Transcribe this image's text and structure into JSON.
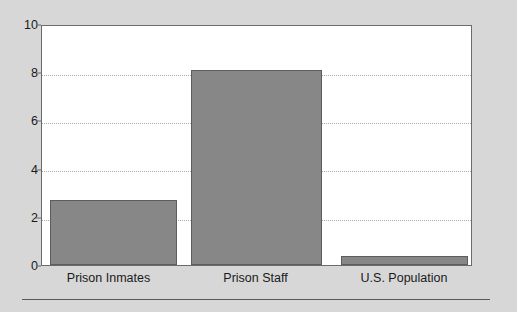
{
  "chart_data": {
    "type": "bar",
    "title": "",
    "subtitle": "",
    "xlabel": "",
    "ylabel": "",
    "categories": [
      "Prison Inmates",
      "Prison Staff",
      "U.S. Population"
    ],
    "values": [
      2.7,
      8.1,
      0.37
    ],
    "series": [
      {
        "name": "Rate",
        "values": [
          2.7,
          8.1,
          0.37
        ]
      }
    ],
    "ylim": [
      0,
      10
    ],
    "yticks": [
      0,
      2,
      4,
      6,
      8,
      10
    ],
    "ytick_labels": [
      "0",
      "2",
      "4",
      "6",
      "8",
      "10"
    ],
    "grid": "horizontal-dotted",
    "legend": "none",
    "bar_color": "#878787",
    "bar_edge_color": "#5d5d5d",
    "plot_background": "#ffffff",
    "figure_background": "#d7d7d7",
    "axis_color": "#6b6b6b",
    "gridline_color": "#a8a8a8",
    "text_color": "#1a1a1a",
    "annotations": []
  },
  "figure": {
    "bottom_rule_label": ""
  }
}
